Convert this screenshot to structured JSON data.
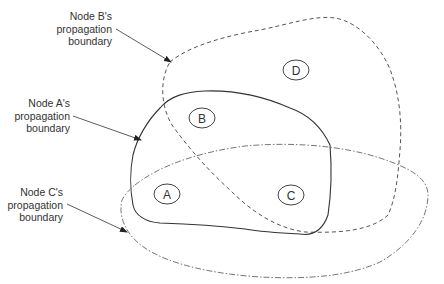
{
  "diagram": {
    "type": "network-propagation-boundaries",
    "callouts": [
      {
        "id": "B",
        "lines": [
          "Node B's",
          "propagation",
          "boundary"
        ]
      },
      {
        "id": "A",
        "lines": [
          "Node A's",
          "propagation",
          "boundary"
        ]
      },
      {
        "id": "C",
        "lines": [
          "Node C's",
          "propagation",
          "boundary"
        ]
      }
    ],
    "boundaries": [
      {
        "node": "A",
        "style": "solid"
      },
      {
        "node": "B",
        "style": "dashed"
      },
      {
        "node": "C",
        "style": "dash-dot"
      }
    ],
    "nodes": [
      {
        "label": "A"
      },
      {
        "label": "B"
      },
      {
        "label": "C"
      },
      {
        "label": "D"
      }
    ],
    "colors": {
      "line": "#444444",
      "text": "#333333",
      "background": "#ffffff"
    }
  }
}
